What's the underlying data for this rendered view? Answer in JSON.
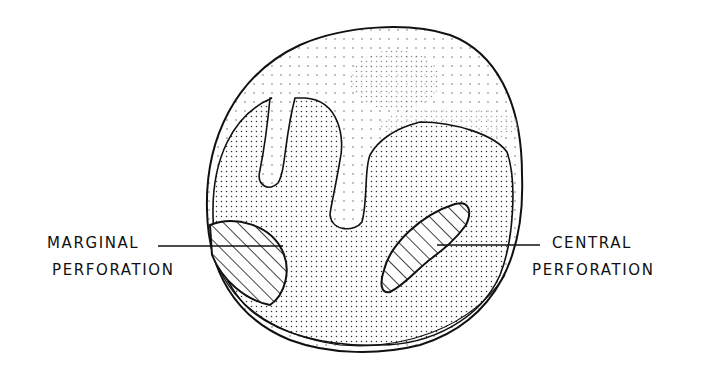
{
  "diagram": {
    "labels": {
      "marginal": {
        "line1": "MARGINAL",
        "line2": "PERFORATION"
      },
      "central": {
        "line1": "CENTRAL",
        "line2": "PERFORATION"
      }
    },
    "colors": {
      "ink": "#111111",
      "background": "#ffffff"
    }
  }
}
